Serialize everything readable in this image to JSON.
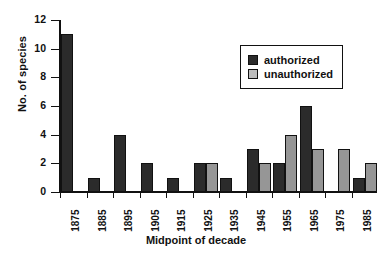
{
  "chart_data": {
    "type": "bar",
    "title": "",
    "xlabel": "Midpoint of decade",
    "ylabel": "No. of species",
    "categories": [
      "1875",
      "1885",
      "1895",
      "1905",
      "1915",
      "1925",
      "1935",
      "1945",
      "1955",
      "1965",
      "1975",
      "1985"
    ],
    "series": [
      {
        "name": "authorized",
        "color": "#2b2b2b",
        "values": [
          11,
          1,
          4,
          2,
          1,
          2,
          1,
          3,
          2,
          6,
          0,
          1
        ]
      },
      {
        "name": "unauthorized",
        "color": "#969696",
        "values": [
          0,
          0,
          0,
          0,
          0,
          2,
          0,
          2,
          4,
          3,
          3,
          2
        ]
      }
    ],
    "ylim": [
      0,
      12
    ],
    "yticks": [
      0,
      2,
      4,
      6,
      8,
      10,
      12
    ],
    "ytick_labels": [
      "0",
      "2",
      "4",
      "6",
      "8",
      "10",
      "12"
    ],
    "grid": false,
    "legend_position": "upper right",
    "legend_entries": [
      "authorized",
      "unauthorized"
    ]
  }
}
